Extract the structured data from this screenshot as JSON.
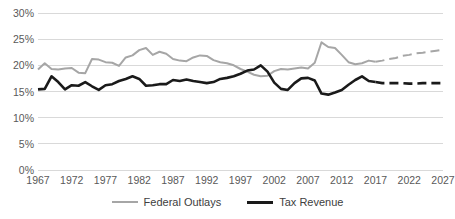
{
  "chart_data": {
    "type": "line",
    "title": "",
    "subtitle": "",
    "xlabel": "",
    "ylabel": "",
    "xlim": [
      1967,
      2027
    ],
    "ylim": [
      0,
      30
    ],
    "grid": true,
    "legend_position": "bottom",
    "y_ticks": [
      "0%",
      "5%",
      "10%",
      "15%",
      "20%",
      "25%",
      "30%"
    ],
    "y_tick_values": [
      0,
      5,
      10,
      15,
      20,
      25,
      30
    ],
    "x_ticks": [
      "1967",
      "1972",
      "1977",
      "1982",
      "1987",
      "1992",
      "1997",
      "2002",
      "2007",
      "2012",
      "2017",
      "2022",
      "2027"
    ],
    "x_tick_values": [
      1967,
      1972,
      1977,
      1982,
      1987,
      1992,
      1997,
      2002,
      2007,
      2012,
      2017,
      2022,
      2027
    ],
    "projection_start_year": 2017,
    "x": [
      1967,
      1968,
      1969,
      1970,
      1971,
      1972,
      1973,
      1974,
      1975,
      1976,
      1977,
      1978,
      1979,
      1980,
      1981,
      1982,
      1983,
      1984,
      1985,
      1986,
      1987,
      1988,
      1989,
      1990,
      1991,
      1992,
      1993,
      1994,
      1995,
      1996,
      1997,
      1998,
      1999,
      2000,
      2001,
      2002,
      2003,
      2004,
      2005,
      2006,
      2007,
      2008,
      2009,
      2010,
      2011,
      2012,
      2013,
      2014,
      2015,
      2016,
      2017,
      2018,
      2019,
      2020,
      2021,
      2022,
      2023,
      2024,
      2025,
      2026,
      2027
    ],
    "series": [
      {
        "name": "Federal Outlays",
        "color": "#a6a6a6",
        "style": "solid-then-dashed",
        "values": [
          19.2,
          20.4,
          19.3,
          19.2,
          19.4,
          19.5,
          18.6,
          18.5,
          21.2,
          21.1,
          20.6,
          20.5,
          19.9,
          21.5,
          21.9,
          22.9,
          23.3,
          22.0,
          22.6,
          22.2,
          21.2,
          20.9,
          20.8,
          21.5,
          21.9,
          21.8,
          21.0,
          20.6,
          20.4,
          20.0,
          19.3,
          18.8,
          18.2,
          17.9,
          18.0,
          18.9,
          19.3,
          19.2,
          19.4,
          19.6,
          19.4,
          20.5,
          24.4,
          23.5,
          23.3,
          22.0,
          20.6,
          20.2,
          20.4,
          20.9,
          20.7,
          20.9,
          21.2,
          21.4,
          21.8,
          22.0,
          22.3,
          22.4,
          22.6,
          22.8,
          23.0
        ]
      },
      {
        "name": "Tax Revenue",
        "color": "#1a1a1a",
        "style": "solid-then-dashed",
        "values": [
          15.4,
          15.5,
          17.9,
          16.8,
          15.4,
          16.2,
          16.1,
          16.8,
          16.0,
          15.3,
          16.2,
          16.4,
          17.0,
          17.4,
          17.9,
          17.4,
          16.1,
          16.2,
          16.4,
          16.4,
          17.2,
          17.0,
          17.3,
          17.0,
          16.8,
          16.6,
          16.8,
          17.4,
          17.6,
          17.9,
          18.4,
          19.0,
          19.2,
          20.0,
          18.8,
          16.7,
          15.5,
          15.3,
          16.6,
          17.5,
          17.6,
          17.1,
          14.6,
          14.4,
          14.8,
          15.3,
          16.3,
          17.2,
          17.9,
          17.0,
          16.8,
          16.6,
          16.6,
          16.6,
          16.6,
          16.5,
          16.5,
          16.6,
          16.6,
          16.6,
          16.6
        ]
      }
    ]
  },
  "legend": {
    "items": [
      {
        "label": "Federal Outlays"
      },
      {
        "label": "Tax Revenue"
      }
    ]
  }
}
